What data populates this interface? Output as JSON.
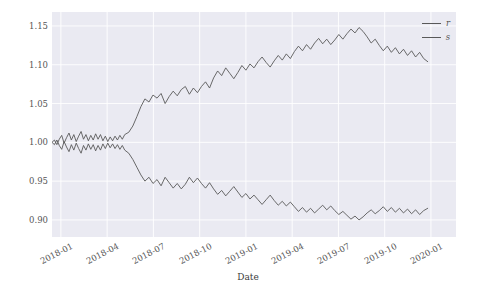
{
  "chart": {
    "type": "line",
    "title": "",
    "xlabel": "Date",
    "ylabel": "",
    "background": "#eaeaf2",
    "gridcolor": "#ffffff",
    "linecolor": "#595959",
    "legend_position": "upper right",
    "yticks": [
      "1.15",
      "1.10",
      "1.05",
      "1.00",
      "0.95",
      "0.90"
    ],
    "ytick_values": [
      1.15,
      1.1,
      1.05,
      1.0,
      0.95,
      0.9
    ],
    "ylim": [
      0.878,
      1.168
    ],
    "xticks": [
      "2018-01",
      "2018-04",
      "2018-07",
      "2018-10",
      "2019-01",
      "2019-04",
      "2019-07",
      "2019-10",
      "2020-01"
    ],
    "xlim": [
      "2017-12-20",
      "2020-02-20"
    ],
    "legend": [
      {
        "name": "r",
        "color": "#595959"
      },
      {
        "name": "s",
        "color": "#595959"
      }
    ]
  },
  "chart_data": {
    "type": "line",
    "title": "",
    "xlabel": "Date",
    "ylabel": "",
    "ylim": [
      0.878,
      1.168
    ],
    "grid": true,
    "legend_position": "upper right",
    "xtick_labels": [
      "2018-01",
      "2018-04",
      "2018-07",
      "2018-10",
      "2019-01",
      "2019-04",
      "2019-07",
      "2019-10",
      "2020-01"
    ],
    "ytick_labels": [
      "0.90",
      "0.95",
      "1.00",
      "1.05",
      "1.10",
      "1.15"
    ],
    "x_fraction_note": "x expressed as fraction 0-1 across axis span 2017-12-20 to 2020-02-20",
    "series": [
      {
        "name": "r",
        "color": "#595959",
        "x": [
          0.0,
          0.006,
          0.012,
          0.018,
          0.024,
          0.03,
          0.036,
          0.042,
          0.048,
          0.054,
          0.06,
          0.066,
          0.072,
          0.078,
          0.084,
          0.09,
          0.096,
          0.102,
          0.108,
          0.114,
          0.12,
          0.126,
          0.132,
          0.138,
          0.144,
          0.15,
          0.156,
          0.162,
          0.168,
          0.174,
          0.18,
          0.19,
          0.2,
          0.21,
          0.22,
          0.23,
          0.24,
          0.25,
          0.26,
          0.27,
          0.28,
          0.29,
          0.3,
          0.31,
          0.32,
          0.33,
          0.34,
          0.35,
          0.36,
          0.37,
          0.38,
          0.39,
          0.4,
          0.41,
          0.42,
          0.43,
          0.44,
          0.45,
          0.46,
          0.47,
          0.48,
          0.49,
          0.5,
          0.51,
          0.52,
          0.53,
          0.54,
          0.55,
          0.56,
          0.57,
          0.58,
          0.59,
          0.6,
          0.61,
          0.62,
          0.63,
          0.64,
          0.65,
          0.66,
          0.67,
          0.68,
          0.69,
          0.7,
          0.71,
          0.72,
          0.73,
          0.74,
          0.75,
          0.76,
          0.77,
          0.78,
          0.79,
          0.8,
          0.81,
          0.82,
          0.83,
          0.84,
          0.85,
          0.86,
          0.87,
          0.88,
          0.89,
          0.9,
          0.91,
          0.92,
          0.93
        ],
        "y": [
          1.0,
          1.003,
          0.997,
          1.004,
          1.009,
          0.999,
          1.006,
          1.012,
          1.003,
          1.01,
          1.001,
          1.008,
          1.014,
          1.004,
          1.01,
          1.002,
          1.009,
          1.003,
          1.011,
          1.004,
          1.01,
          1.002,
          1.008,
          1.001,
          1.007,
          1.002,
          1.008,
          1.003,
          1.009,
          1.004,
          1.01,
          1.013,
          1.021,
          1.033,
          1.046,
          1.056,
          1.052,
          1.061,
          1.057,
          1.063,
          1.05,
          1.059,
          1.066,
          1.06,
          1.068,
          1.072,
          1.062,
          1.07,
          1.064,
          1.072,
          1.078,
          1.07,
          1.083,
          1.092,
          1.086,
          1.096,
          1.089,
          1.082,
          1.09,
          1.099,
          1.093,
          1.101,
          1.096,
          1.104,
          1.11,
          1.103,
          1.097,
          1.105,
          1.112,
          1.106,
          1.114,
          1.108,
          1.117,
          1.124,
          1.118,
          1.126,
          1.12,
          1.128,
          1.134,
          1.127,
          1.133,
          1.126,
          1.132,
          1.139,
          1.133,
          1.14,
          1.146,
          1.141,
          1.148,
          1.143,
          1.136,
          1.128,
          1.133,
          1.125,
          1.118,
          1.124,
          1.116,
          1.122,
          1.114,
          1.12,
          1.112,
          1.118,
          1.11,
          1.116,
          1.108,
          1.104
        ]
      },
      {
        "name": "s",
        "color": "#595959",
        "x": [
          0.0,
          0.006,
          0.012,
          0.018,
          0.024,
          0.03,
          0.036,
          0.042,
          0.048,
          0.054,
          0.06,
          0.066,
          0.072,
          0.078,
          0.084,
          0.09,
          0.096,
          0.102,
          0.108,
          0.114,
          0.12,
          0.126,
          0.132,
          0.138,
          0.144,
          0.15,
          0.156,
          0.162,
          0.168,
          0.174,
          0.18,
          0.19,
          0.2,
          0.21,
          0.22,
          0.23,
          0.24,
          0.25,
          0.26,
          0.27,
          0.28,
          0.29,
          0.3,
          0.31,
          0.32,
          0.33,
          0.34,
          0.35,
          0.36,
          0.37,
          0.38,
          0.39,
          0.4,
          0.41,
          0.42,
          0.43,
          0.44,
          0.45,
          0.46,
          0.47,
          0.48,
          0.49,
          0.5,
          0.51,
          0.52,
          0.53,
          0.54,
          0.55,
          0.56,
          0.57,
          0.58,
          0.59,
          0.6,
          0.61,
          0.62,
          0.63,
          0.64,
          0.65,
          0.66,
          0.67,
          0.68,
          0.69,
          0.7,
          0.71,
          0.72,
          0.73,
          0.74,
          0.75,
          0.76,
          0.77,
          0.78,
          0.79,
          0.8,
          0.81,
          0.82,
          0.83,
          0.84,
          0.85,
          0.86,
          0.87,
          0.88,
          0.89,
          0.9,
          0.91,
          0.92,
          0.93
        ],
        "y": [
          1.0,
          0.997,
          1.003,
          0.996,
          0.991,
          1.001,
          0.994,
          0.988,
          0.997,
          0.99,
          0.999,
          0.992,
          0.986,
          0.996,
          0.99,
          0.998,
          0.991,
          0.997,
          0.989,
          0.996,
          0.99,
          0.998,
          0.992,
          0.999,
          0.993,
          0.998,
          0.992,
          0.997,
          0.991,
          0.996,
          0.99,
          0.986,
          0.978,
          0.968,
          0.958,
          0.95,
          0.955,
          0.947,
          0.952,
          0.944,
          0.955,
          0.948,
          0.941,
          0.947,
          0.94,
          0.946,
          0.955,
          0.948,
          0.954,
          0.947,
          0.941,
          0.948,
          0.94,
          0.933,
          0.938,
          0.931,
          0.937,
          0.943,
          0.936,
          0.929,
          0.934,
          0.927,
          0.932,
          0.926,
          0.92,
          0.926,
          0.932,
          0.925,
          0.919,
          0.924,
          0.918,
          0.923,
          0.917,
          0.911,
          0.916,
          0.91,
          0.915,
          0.909,
          0.914,
          0.919,
          0.913,
          0.918,
          0.912,
          0.907,
          0.911,
          0.906,
          0.901,
          0.905,
          0.9,
          0.904,
          0.909,
          0.913,
          0.908,
          0.912,
          0.917,
          0.911,
          0.916,
          0.91,
          0.915,
          0.909,
          0.914,
          0.908,
          0.913,
          0.907,
          0.912,
          0.915
        ]
      }
    ]
  }
}
